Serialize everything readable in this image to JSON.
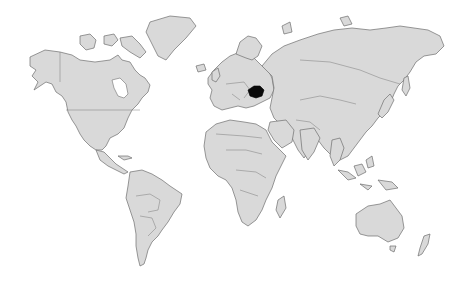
{
  "map": {
    "type": "world-locator-map",
    "projection": "mercator",
    "background_color": "#ffffff",
    "land_color": "#d9d9d9",
    "border_color": "#6e6e6e",
    "highlighted_region": {
      "name": "Romania",
      "color": "#0a0a0a"
    }
  }
}
